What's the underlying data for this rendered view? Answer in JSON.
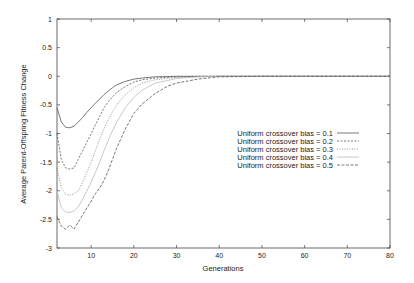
{
  "chart_data": {
    "type": "line",
    "title": "",
    "xlabel": "Generations",
    "ylabel": "Average Parent-Offspring Fitness Change",
    "xlim": [
      2,
      80
    ],
    "ylim": [
      -3,
      1
    ],
    "grid": false,
    "legend_position": "center-right",
    "x_ticks": [
      10,
      20,
      30,
      40,
      50,
      60,
      70,
      80
    ],
    "y_ticks": [
      1,
      0.5,
      0,
      -0.5,
      -1,
      -1.5,
      -2,
      -2.5,
      -3
    ],
    "y_tick_labels": [
      "1",
      "0.5",
      "0",
      "-0.5",
      "-1",
      "-1.5",
      "-2",
      "-2.5",
      "-3"
    ],
    "x_tick_labels": [
      "10",
      "20",
      "30",
      "40",
      "50",
      "60",
      "70",
      "80"
    ],
    "series": [
      {
        "name": "Uniform crossover bias = 0.1",
        "dash": "",
        "color": "#555555",
        "x": [
          2,
          3,
          4,
          5,
          6,
          7,
          8,
          9,
          10,
          11,
          12,
          13,
          14,
          15,
          16,
          18,
          20,
          22,
          25,
          30,
          40,
          50,
          60,
          70,
          80
        ],
        "values": [
          -0.55,
          -0.8,
          -0.89,
          -0.9,
          -0.87,
          -0.8,
          -0.72,
          -0.63,
          -0.55,
          -0.47,
          -0.4,
          -0.32,
          -0.26,
          -0.2,
          -0.15,
          -0.09,
          -0.05,
          -0.03,
          -0.01,
          0,
          0,
          0,
          0,
          0,
          0
        ]
      },
      {
        "name": "Uniform crossover bias = 0.2",
        "dash": "2,1.5",
        "color": "#555555",
        "x": [
          2,
          3,
          4,
          5,
          6,
          7,
          8,
          9,
          10,
          11,
          12,
          13,
          14,
          15,
          16,
          18,
          20,
          22,
          25,
          30,
          35,
          40,
          50,
          60,
          70,
          80
        ],
        "values": [
          -1.0,
          -1.45,
          -1.6,
          -1.62,
          -1.6,
          -1.45,
          -1.3,
          -1.15,
          -1.0,
          -0.85,
          -0.7,
          -0.55,
          -0.45,
          -0.36,
          -0.28,
          -0.18,
          -0.1,
          -0.06,
          -0.03,
          -0.01,
          0,
          0,
          0,
          0,
          0,
          0
        ]
      },
      {
        "name": "Uniform crossover bias = 0.3",
        "dash": "1,1.5",
        "color": "#777777",
        "x": [
          2,
          3,
          4,
          5,
          6,
          7,
          8,
          9,
          10,
          11,
          12,
          13,
          14,
          15,
          16,
          18,
          20,
          22,
          25,
          30,
          35,
          40,
          50,
          60,
          70,
          80
        ],
        "values": [
          -1.6,
          -1.95,
          -2.06,
          -2.08,
          -2.05,
          -2.0,
          -1.85,
          -1.68,
          -1.5,
          -1.3,
          -1.1,
          -0.92,
          -0.76,
          -0.62,
          -0.5,
          -0.32,
          -0.2,
          -0.12,
          -0.06,
          -0.02,
          -0.01,
          0,
          0,
          0,
          0,
          0
        ]
      },
      {
        "name": "Uniform crossover bias = 0.4",
        "dash": "",
        "color": "#bbbbbb",
        "x": [
          2,
          3,
          4,
          5,
          6,
          7,
          8,
          9,
          10,
          11,
          12,
          13,
          14,
          15,
          16,
          18,
          20,
          22,
          25,
          30,
          35,
          40,
          50,
          60,
          70,
          80
        ],
        "values": [
          -2.0,
          -2.3,
          -2.37,
          -2.38,
          -2.35,
          -2.28,
          -2.15,
          -2.0,
          -1.85,
          -1.68,
          -1.5,
          -1.3,
          -1.12,
          -0.95,
          -0.8,
          -0.55,
          -0.37,
          -0.24,
          -0.12,
          -0.04,
          -0.01,
          0,
          0,
          0,
          0,
          0
        ]
      },
      {
        "name": "Uniform crossover bias = 0.5",
        "dash": "3,1.5",
        "color": "#555555",
        "x": [
          2,
          3,
          4,
          5,
          6,
          7,
          8,
          9,
          10,
          11,
          12,
          13,
          14,
          15,
          16,
          18,
          20,
          22,
          25,
          28,
          30,
          35,
          40,
          50,
          60,
          70,
          80
        ],
        "values": [
          -2.45,
          -2.62,
          -2.67,
          -2.6,
          -2.67,
          -2.55,
          -2.42,
          -2.3,
          -2.18,
          -2.05,
          -1.95,
          -1.82,
          -1.65,
          -1.45,
          -1.25,
          -0.92,
          -0.65,
          -0.48,
          -0.3,
          -0.17,
          -0.12,
          -0.05,
          -0.01,
          0,
          0,
          0,
          0
        ]
      }
    ]
  }
}
